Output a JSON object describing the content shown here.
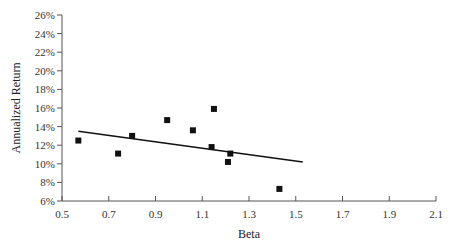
{
  "chart_data": {
    "type": "scatter",
    "title": "",
    "xlabel": "Beta",
    "ylabel": "Annualized Return",
    "xlim": [
      0.5,
      2.1
    ],
    "ylim": [
      6,
      26
    ],
    "x_ticks": [
      0.5,
      0.7,
      0.9,
      1.1,
      1.3,
      1.5,
      1.7,
      1.9,
      2.1
    ],
    "x_tick_labels": [
      "0.5",
      "0.7",
      "0.9",
      "1.1",
      "1.3",
      "1.5",
      "1.7",
      "1.9",
      "2.1"
    ],
    "y_ticks": [
      6,
      8,
      10,
      12,
      14,
      16,
      18,
      20,
      22,
      24,
      26
    ],
    "y_tick_labels": [
      "6%",
      "8%",
      "10%",
      "12%",
      "14%",
      "16%",
      "18%",
      "20%",
      "22%",
      "24%",
      "26%"
    ],
    "grid": false,
    "legend": null,
    "series": [
      {
        "name": "Stocks",
        "marker": "square",
        "color": "#111111",
        "points": [
          {
            "x": 0.57,
            "y": 12.5
          },
          {
            "x": 0.74,
            "y": 11.1
          },
          {
            "x": 0.8,
            "y": 13.0
          },
          {
            "x": 0.95,
            "y": 14.7
          },
          {
            "x": 1.06,
            "y": 13.6
          },
          {
            "x": 1.15,
            "y": 15.9
          },
          {
            "x": 1.14,
            "y": 11.8
          },
          {
            "x": 1.22,
            "y": 11.1
          },
          {
            "x": 1.21,
            "y": 10.2
          },
          {
            "x": 1.43,
            "y": 7.3
          }
        ]
      }
    ],
    "trendline": {
      "name": "Best-fit line",
      "color": "#111111",
      "x": [
        0.57,
        1.53
      ],
      "y": [
        13.5,
        10.2
      ]
    }
  },
  "colors": {
    "axis": "#555555",
    "marker": "#111111",
    "background": "#ffffff"
  }
}
